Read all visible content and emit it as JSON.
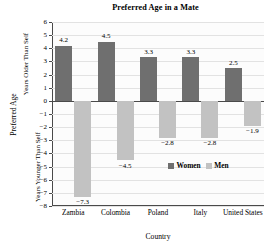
{
  "chart_data": {
    "type": "bar",
    "title": "Preferred Age in a Mate",
    "xlabel": "Country",
    "ylabel": "Preferred Age",
    "ylabel_upper": "Years Older Than Self",
    "ylabel_lower": "Years Younger Than Self",
    "categories": [
      "Zambia",
      "Colombia",
      "Poland",
      "Italy",
      "United States"
    ],
    "series": [
      {
        "name": "Women",
        "color": "#6f6f6f",
        "values": [
          4.2,
          4.5,
          3.3,
          3.3,
          2.5
        ],
        "labels": [
          "4.2",
          "4.5",
          "3.3",
          "3.3",
          "2.5"
        ]
      },
      {
        "name": "Men",
        "color": "#c2c2c2",
        "values": [
          -7.3,
          -4.5,
          -2.8,
          -2.8,
          -1.9
        ],
        "labels": [
          "−7.3",
          "−4.5",
          "−2.8",
          "−2.8",
          "−1.9"
        ]
      }
    ],
    "ylim": [
      -8,
      6
    ],
    "yticks": [
      6,
      5,
      4,
      3,
      2,
      1,
      0,
      -1,
      -2,
      -3,
      -4,
      -5,
      -6,
      -7,
      -8
    ],
    "ytick_labels": [
      "6",
      "5",
      "4",
      "3",
      "2",
      "1",
      "0",
      "−1",
      "−2",
      "−3",
      "−4",
      "−5",
      "−6",
      "−7",
      "−8"
    ],
    "grid": true,
    "legend_position": "inside-lower-right",
    "legend": [
      "Women",
      "Men"
    ]
  }
}
